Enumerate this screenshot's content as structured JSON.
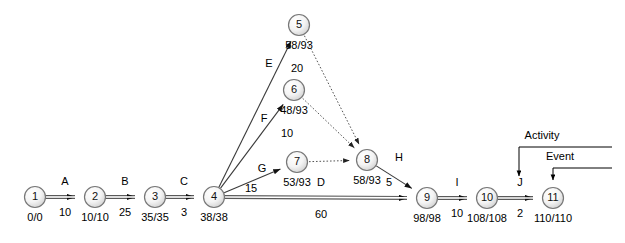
{
  "diagram": {
    "type": "network-diagram",
    "width": 625,
    "height": 243,
    "colors": {
      "background": "#ffffff",
      "node_stroke": "#777777",
      "node_fill_light": "#ffffff",
      "node_fill_shade": "#d9d9d9",
      "solid_edge": "#5a5a5a",
      "thin_edge": "#3a3a3a",
      "dotted_edge": "#555555",
      "text": "#000000"
    },
    "nodes": [
      {
        "id": "1",
        "label": "1",
        "times": "0/0",
        "cx": 35,
        "cy": 197
      },
      {
        "id": "2",
        "label": "2",
        "times": "10/10",
        "cx": 95,
        "cy": 197
      },
      {
        "id": "3",
        "label": "3",
        "times": "35/35",
        "cx": 155,
        "cy": 197
      },
      {
        "id": "4",
        "label": "4",
        "times": "38/38",
        "cx": 214,
        "cy": 197
      },
      {
        "id": "5",
        "label": "5",
        "times": "58/93",
        "cx": 299,
        "cy": 25
      },
      {
        "id": "6",
        "label": "6",
        "times": "48/93",
        "cx": 294,
        "cy": 90
      },
      {
        "id": "7",
        "label": "7",
        "times": "53/93",
        "cx": 297,
        "cy": 162
      },
      {
        "id": "8",
        "label": "8",
        "times": "58/93",
        "cx": 367,
        "cy": 160
      },
      {
        "id": "9",
        "label": "9",
        "times": "98/98",
        "cx": 427,
        "cy": 198
      },
      {
        "id": "10",
        "label": "10",
        "times": "108/108",
        "cx": 487,
        "cy": 198
      },
      {
        "id": "11",
        "label": "11",
        "times": "110/110",
        "cx": 553,
        "cy": 198
      }
    ],
    "edges": [
      {
        "id": "A",
        "name": "A",
        "duration": "10",
        "from": "1",
        "to": "2",
        "style": "solid",
        "name_x": 65,
        "name_y": 185,
        "dur_x": 65,
        "dur_y": 216
      },
      {
        "id": "B",
        "name": "B",
        "duration": "25",
        "from": "2",
        "to": "3",
        "style": "solid",
        "name_x": 125,
        "name_y": 185,
        "dur_x": 125,
        "dur_y": 216
      },
      {
        "id": "C",
        "name": "C",
        "duration": "3",
        "from": "3",
        "to": "4",
        "style": "solid",
        "name_x": 184,
        "name_y": 185,
        "dur_x": 184,
        "dur_y": 216
      },
      {
        "id": "E",
        "name": "E",
        "duration": "20",
        "from": "4",
        "to": "5",
        "style": "thin",
        "name_x": 269,
        "name_y": 67,
        "dur_x": 297,
        "dur_y": 72
      },
      {
        "id": "F",
        "name": "F",
        "duration": "10",
        "from": "4",
        "to": "6",
        "style": "thin",
        "name_x": 264,
        "name_y": 122,
        "dur_x": 287,
        "dur_y": 137
      },
      {
        "id": "G",
        "name": "G",
        "duration": "15",
        "from": "4",
        "to": "7",
        "style": "thin",
        "name_x": 262,
        "name_y": 172,
        "dur_x": 251,
        "dur_y": 192
      },
      {
        "id": "D",
        "name": "D",
        "duration": "60",
        "from": "4",
        "to": "9",
        "style": "solid",
        "name_x": 321,
        "name_y": 186,
        "dur_x": 321,
        "dur_y": 218
      },
      {
        "id": "H",
        "name": "H",
        "duration": "5",
        "from": "8",
        "to": "9",
        "style": "thin",
        "name_x": 399,
        "name_y": 161,
        "dur_x": 389,
        "dur_y": 186
      },
      {
        "id": "I",
        "name": "I",
        "duration": "10",
        "from": "9",
        "to": "10",
        "style": "solid",
        "name_x": 457,
        "name_y": 186,
        "dur_x": 457,
        "dur_y": 217
      },
      {
        "id": "J",
        "name": "J",
        "duration": "2",
        "from": "10",
        "to": "11",
        "style": "solid",
        "name_x": 520,
        "name_y": 186,
        "dur_x": 520,
        "dur_y": 217
      },
      {
        "id": "dummy-5-8",
        "name": "",
        "duration": "",
        "from": "5",
        "to": "8",
        "style": "dotted"
      },
      {
        "id": "dummy-6-8",
        "name": "",
        "duration": "",
        "from": "6",
        "to": "8",
        "style": "dotted"
      },
      {
        "id": "dummy-7-8",
        "name": "",
        "duration": "",
        "from": "7",
        "to": "8",
        "style": "dotted"
      }
    ],
    "annotations": [
      {
        "id": "activity",
        "label": "Activity",
        "text_x": 542,
        "text_y": 139,
        "line_y": 147,
        "line_x1": 519,
        "line_x2": 612,
        "arrow_x": 519,
        "arrow_y2": 176
      },
      {
        "id": "event",
        "label": "Event",
        "text_x": 560,
        "text_y": 160,
        "line_y": 168,
        "line_x1": 553,
        "line_x2": 612,
        "arrow_x": 553,
        "arrow_y2": 180
      }
    ]
  }
}
